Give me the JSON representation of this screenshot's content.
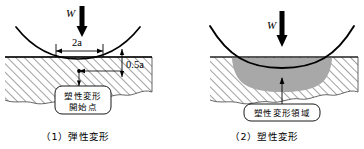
{
  "figure": {
    "background_color": "#ffffff",
    "line_color": "#000000",
    "hatch_color": "#555555",
    "plastic_zone_fill": "#a8a8a8"
  },
  "panels": [
    {
      "id": "elastic",
      "caption": "（1）弾性変形",
      "load_label": "W",
      "contact_width_label": "2a",
      "depth_label": "0.5a",
      "callout": {
        "line1": "塑性変形",
        "line2": "開始点"
      }
    },
    {
      "id": "plastic",
      "caption": "（2）塑性変形",
      "load_label": "W",
      "callout": {
        "line1": "塑性変形領域"
      }
    }
  ]
}
